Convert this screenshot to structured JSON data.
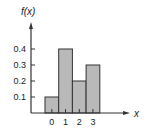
{
  "chart_data": {
    "type": "bar",
    "title": "",
    "xlabel": "x",
    "ylabel": "f(x)",
    "categories": [
      "0",
      "1",
      "2",
      "3"
    ],
    "values": [
      0.1,
      0.4,
      0.2,
      0.3
    ],
    "yticks": [
      "0.1",
      "0.2",
      "0.3",
      "0.4"
    ],
    "ylim": [
      0,
      0.5
    ],
    "grid": false,
    "legend": null,
    "bar_color": "#b9b9b9",
    "edge_color": "#333333"
  }
}
